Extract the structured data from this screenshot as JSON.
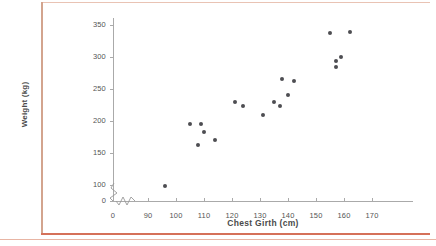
{
  "figure": {
    "frame_color": "#d5715a",
    "background": "#ffffff"
  },
  "chart_data": {
    "type": "scatter",
    "title": "",
    "xlabel": "Chest Girth (cm)",
    "ylabel": "Weight (kg)",
    "xlim": [
      0,
      175
    ],
    "ylim": [
      0,
      360
    ],
    "xticks": [
      0,
      90,
      100,
      110,
      120,
      130,
      140,
      150,
      160,
      170
    ],
    "yticks": [
      0,
      100,
      150,
      200,
      250,
      300,
      350
    ],
    "xtick_labels": [
      "0",
      "90",
      "100",
      "110",
      "120",
      "130",
      "140",
      "150",
      "160",
      "170"
    ],
    "ytick_labels": [
      "0",
      "100",
      "150",
      "200",
      "250",
      "300",
      "350"
    ],
    "axis_break_x": true,
    "axis_break_y": true,
    "grid": false,
    "legend": null,
    "marker_color": "#4d4d52",
    "points": [
      {
        "x": 96,
        "y": 98
      },
      {
        "x": 105,
        "y": 195
      },
      {
        "x": 108,
        "y": 162
      },
      {
        "x": 109,
        "y": 196
      },
      {
        "x": 110,
        "y": 183
      },
      {
        "x": 114,
        "y": 170
      },
      {
        "x": 121,
        "y": 230
      },
      {
        "x": 124,
        "y": 224
      },
      {
        "x": 131,
        "y": 210
      },
      {
        "x": 135,
        "y": 230
      },
      {
        "x": 137,
        "y": 224
      },
      {
        "x": 138,
        "y": 265
      },
      {
        "x": 140,
        "y": 240
      },
      {
        "x": 142,
        "y": 263
      },
      {
        "x": 155,
        "y": 337
      },
      {
        "x": 157,
        "y": 284
      },
      {
        "x": 157,
        "y": 294
      },
      {
        "x": 159,
        "y": 300
      },
      {
        "x": 162,
        "y": 339
      }
    ]
  }
}
